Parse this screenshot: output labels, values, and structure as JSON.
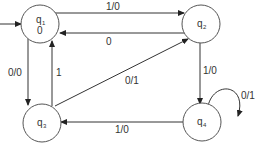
{
  "diagram": {
    "type": "finite-state-machine",
    "states": [
      {
        "id": "q1",
        "name": "q",
        "sub": "1",
        "output": "0",
        "initial": true
      },
      {
        "id": "q2",
        "name": "q",
        "sub": "2",
        "output": ""
      },
      {
        "id": "q3",
        "name": "q",
        "sub": "3",
        "output": ""
      },
      {
        "id": "q4",
        "name": "q",
        "sub": "4",
        "output": ""
      }
    ],
    "transitions": [
      {
        "from": "q1",
        "to": "q2",
        "label": "1/0"
      },
      {
        "from": "q2",
        "to": "q1",
        "label": "0"
      },
      {
        "from": "q1",
        "to": "q3",
        "label": "0/0"
      },
      {
        "from": "q3",
        "to": "q1",
        "label": "1"
      },
      {
        "from": "q3",
        "to": "q2",
        "label": "0/1"
      },
      {
        "from": "q2",
        "to": "q4",
        "label": "1/0"
      },
      {
        "from": "q4",
        "to": "q4",
        "label": "0/1"
      },
      {
        "from": "q4",
        "to": "q3",
        "label": "1/0"
      }
    ],
    "colors": {
      "stroke": "#333333",
      "background": "#ffffff"
    }
  }
}
